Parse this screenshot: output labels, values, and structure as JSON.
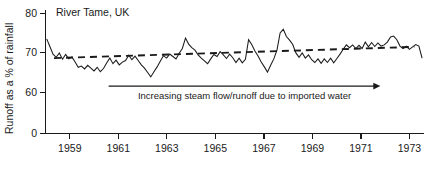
{
  "chart_data": {
    "type": "line",
    "title": "River Tame, UK",
    "xlabel": "",
    "ylabel": "Runoff as a % of rainfall",
    "xlim": [
      1958.0,
      1973.6
    ],
    "ylim": [
      57.0,
      81.0
    ],
    "yticks": [
      0,
      60,
      70,
      80
    ],
    "ytick_labels": [
      "0",
      "60",
      "70",
      "80"
    ],
    "xticks": [
      1959,
      1961,
      1963,
      1965,
      1967,
      1969,
      1971,
      1973
    ],
    "xtick_labels": [
      "1959",
      "1961",
      "1963",
      "1965",
      "1967",
      "1969",
      "1971",
      "1973"
    ],
    "grid": false,
    "legend": "none",
    "axis_break": true,
    "axis_break_note": "y-axis broken between 0 and 60",
    "annotations": [
      {
        "name": "trend-arrow",
        "text": "Increasing steam flow/runoff due to imported water",
        "arrow_from_year": 1960.6,
        "arrow_to_year": 1971.8,
        "arrow_y_value": 61.6
      }
    ],
    "series": [
      {
        "name": "Runoff as a % of rainfall",
        "style": "solid",
        "x": [
          1958.05,
          1958.18,
          1958.31,
          1958.44,
          1958.57,
          1958.7,
          1958.83,
          1958.96,
          1959.09,
          1959.22,
          1959.35,
          1959.48,
          1959.61,
          1959.74,
          1959.87,
          1960.0,
          1960.13,
          1960.26,
          1960.39,
          1960.52,
          1960.65,
          1960.78,
          1960.91,
          1961.04,
          1961.17,
          1961.3,
          1961.43,
          1961.56,
          1961.69,
          1961.82,
          1961.95,
          1962.08,
          1962.21,
          1962.34,
          1962.47,
          1962.6,
          1962.73,
          1962.86,
          1962.99,
          1963.12,
          1963.25,
          1963.38,
          1963.51,
          1963.64,
          1963.77,
          1963.9,
          1964.03,
          1964.16,
          1964.29,
          1964.42,
          1964.55,
          1964.68,
          1964.81,
          1964.94,
          1965.07,
          1965.2,
          1965.33,
          1965.46,
          1965.59,
          1965.72,
          1965.85,
          1965.98,
          1966.11,
          1966.24,
          1966.37,
          1966.5,
          1966.63,
          1966.76,
          1966.89,
          1967.02,
          1967.15,
          1967.28,
          1967.41,
          1967.54,
          1967.67,
          1967.8,
          1967.93,
          1968.06,
          1968.19,
          1968.32,
          1968.45,
          1968.58,
          1968.71,
          1968.84,
          1968.97,
          1969.1,
          1969.23,
          1969.36,
          1969.49,
          1969.62,
          1969.75,
          1969.88,
          1970.01,
          1970.14,
          1970.27,
          1970.4,
          1970.53,
          1970.66,
          1970.79,
          1970.92,
          1971.05,
          1971.18,
          1971.31,
          1971.44,
          1971.57,
          1971.7,
          1971.83,
          1971.96,
          1972.09,
          1972.22,
          1972.35,
          1972.48,
          1972.61,
          1972.74,
          1972.87,
          1973.0,
          1973.13,
          1973.26,
          1973.39,
          1973.52
        ],
        "values": [
          73.4,
          71.5,
          69.6,
          68.8,
          69.9,
          68.3,
          69.5,
          68.4,
          68.9,
          67.6,
          66.3,
          66.6,
          65.9,
          66.8,
          66.1,
          65.4,
          66.3,
          65.2,
          66.0,
          67.4,
          68.6,
          67.2,
          68.1,
          66.9,
          67.6,
          68.0,
          69.3,
          68.2,
          69.1,
          68.0,
          66.9,
          66.1,
          65.0,
          63.9,
          65.2,
          66.4,
          67.8,
          69.2,
          68.6,
          69.6,
          69.0,
          68.4,
          69.8,
          71.0,
          73.6,
          72.1,
          71.2,
          70.6,
          69.4,
          68.6,
          67.9,
          67.2,
          68.4,
          69.5,
          69.0,
          70.2,
          69.4,
          68.5,
          69.6,
          68.7,
          67.5,
          68.6,
          67.4,
          68.3,
          73.2,
          72.0,
          70.4,
          69.1,
          67.6,
          66.4,
          65.1,
          66.8,
          68.4,
          70.6,
          74.9,
          75.8,
          74.0,
          73.1,
          72.0,
          69.9,
          68.8,
          69.9,
          68.6,
          69.4,
          68.2,
          67.5,
          68.4,
          67.3,
          68.4,
          67.5,
          68.6,
          67.4,
          68.5,
          69.6,
          70.8,
          71.9,
          71.2,
          71.9,
          71.0,
          71.8,
          71.0,
          72.6,
          71.4,
          72.5,
          71.5,
          72.4,
          71.6,
          71.9,
          72.6,
          73.9,
          74.1,
          73.2,
          71.6,
          71.0,
          71.6,
          70.8,
          71.4,
          72.0,
          71.6,
          68.6
        ]
      },
      {
        "name": "trend",
        "style": "dashed",
        "x": [
          1958.35,
          1973.2
        ],
        "values": [
          68.6,
          71.4
        ]
      }
    ]
  }
}
